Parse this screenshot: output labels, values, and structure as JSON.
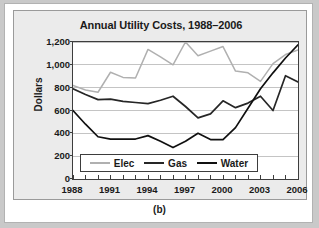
{
  "figure": {
    "caption": "(b)"
  },
  "chart_data": {
    "type": "line",
    "title": "Annual Utility Costs, 1988–2006",
    "xlabel": "",
    "ylabel": "Dollars",
    "ylim": [
      0,
      1200
    ],
    "ytick_step": 200,
    "ytick_labels": [
      "1,200",
      "1,000",
      "800",
      "600",
      "400",
      "200",
      "0"
    ],
    "ytick_values": [
      1200,
      1000,
      800,
      600,
      400,
      200,
      0
    ],
    "grid": "horizontal",
    "legend_position": "inside-bottom-center",
    "x": [
      1988,
      1989,
      1990,
      1991,
      1992,
      1993,
      1994,
      1995,
      1996,
      1997,
      1998,
      1999,
      2000,
      2001,
      2002,
      2003,
      2004,
      2005,
      2006
    ],
    "xtick_labels": [
      "1988",
      "1991",
      "1994",
      "1997",
      "2000",
      "2003",
      "2006"
    ],
    "xtick_values": [
      1988,
      1991,
      1994,
      1997,
      2000,
      2003,
      2006
    ],
    "xlim": [
      1988,
      2006
    ],
    "series": [
      {
        "name": "Elec",
        "color": "#b0b0b0",
        "values": [
          820,
          780,
          760,
          935,
          890,
          885,
          1135,
          1070,
          1000,
          1200,
          1080,
          1120,
          1160,
          945,
          930,
          855,
          1010,
          1090,
          1130
        ]
      },
      {
        "name": "Gas",
        "color": "#262626",
        "values": [
          790,
          740,
          695,
          700,
          680,
          670,
          660,
          690,
          725,
          635,
          535,
          570,
          685,
          625,
          665,
          725,
          600,
          905,
          850
        ]
      },
      {
        "name": "Water",
        "color": "#101010",
        "values": [
          600,
          480,
          370,
          350,
          350,
          350,
          380,
          330,
          275,
          330,
          400,
          345,
          345,
          450,
          620,
          790,
          930,
          1060,
          1175
        ]
      }
    ]
  }
}
